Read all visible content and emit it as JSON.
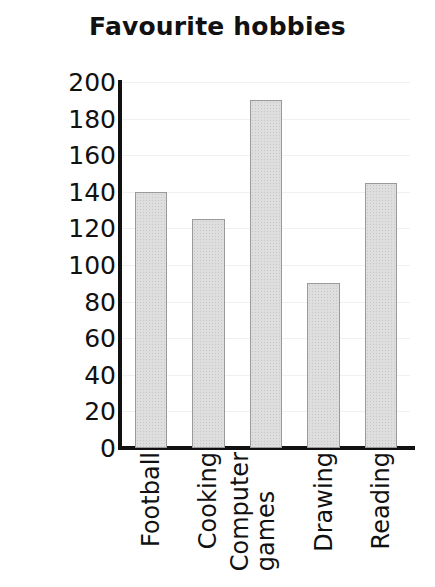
{
  "chart_data": {
    "type": "bar",
    "title": "Favourite hobbies",
    "xlabel": "",
    "ylabel": "Number of people",
    "categories": [
      "Football",
      "Cooking",
      "Computer games",
      "Drawing",
      "Reading"
    ],
    "category_lines": [
      [
        "Football"
      ],
      [
        "Cooking"
      ],
      [
        "Computer",
        "games"
      ],
      [
        "Drawing"
      ],
      [
        "Reading"
      ]
    ],
    "values": [
      140,
      125,
      190,
      90,
      145
    ],
    "ylim": [
      0,
      200
    ],
    "ytick_values": [
      0,
      20,
      40,
      60,
      80,
      100,
      120,
      140,
      160,
      180,
      200
    ],
    "ytick_labels": [
      "0",
      "20",
      "40",
      "60",
      "80",
      "100",
      "120",
      "140",
      "160",
      "180",
      "200"
    ],
    "grid": true,
    "legend": false,
    "bar_fill_color": "#dedede",
    "bar_border_color": "#9a9a9a",
    "axis_color": "#111111",
    "gridline_color": "#f0f0f2",
    "background_color": "#ffffff"
  }
}
